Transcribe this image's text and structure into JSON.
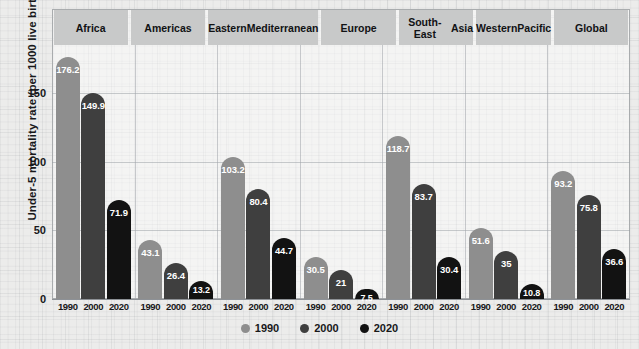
{
  "chart_data": {
    "type": "bar",
    "title": "",
    "xlabel": "",
    "ylabel": "Under-5 mortality rate (per 1000 live births)",
    "ylim": [
      0,
      185
    ],
    "yticks": [
      0,
      50,
      100,
      150
    ],
    "grid": true,
    "legend_position": "bottom-center",
    "categories": [
      "Africa",
      "Americas",
      "Eastern Mediterranean",
      "Europe",
      "South-East Asia",
      "Western Pacific",
      "Global"
    ],
    "group_tick_labels": [
      "1990",
      "2000",
      "2020"
    ],
    "series": [
      {
        "name": "1990",
        "color": "#8e8e8e",
        "values": [
          176.2,
          43.1,
          103.2,
          30.5,
          118.7,
          51.6,
          93.2
        ]
      },
      {
        "name": "2000",
        "color": "#3f3f3f",
        "values": [
          149.9,
          26.4,
          80.4,
          21,
          83.7,
          35,
          75.8
        ]
      },
      {
        "name": "2020",
        "color": "#121212",
        "values": [
          71.9,
          13.2,
          44.7,
          7.5,
          30.4,
          10.8,
          36.6
        ]
      }
    ]
  },
  "axis": {
    "y_title": "Under-5 mortality rate (per 1000 live births)",
    "y_ticks": [
      "150",
      "100",
      "50",
      "0"
    ]
  },
  "headers": [
    "Africa",
    "Americas",
    "Eastern\nMediterranean",
    "Europe",
    "South-East\nAsia",
    "Western\nPacific",
    "Global"
  ],
  "legend": [
    {
      "label": "1990",
      "color": "#8e8e8e"
    },
    {
      "label": "2000",
      "color": "#3f3f3f"
    },
    {
      "label": "2020",
      "color": "#121212"
    }
  ],
  "colors": {
    "background": "#ececeb",
    "header_band": "#c8c9c9",
    "plot_border": "#a9acae",
    "series_1990": "#8e8e8e",
    "series_2000": "#3f3f3f",
    "series_2020": "#121212",
    "text": "#18181a",
    "value_label": "#ffffff"
  }
}
